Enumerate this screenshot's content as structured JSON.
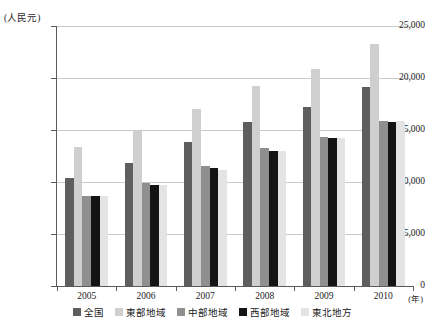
{
  "chart_data": {
    "type": "bar",
    "title": "",
    "xlabel": "(年)",
    "ylabel": "(人民元)",
    "categories": [
      "2005",
      "2006",
      "2007",
      "2008",
      "2009",
      "2010"
    ],
    "ylim": [
      0,
      25000
    ],
    "yticks": [
      "0",
      "5,000",
      "10,000",
      "15,000",
      "20,000",
      "25,000"
    ],
    "ytick_values": [
      0,
      5000,
      10000,
      15000,
      20000,
      25000
    ],
    "grid": true,
    "legend_position": "bottom",
    "series": [
      {
        "name": "全国",
        "color": "#5e5e5e",
        "values": [
          10400,
          11800,
          13800,
          15800,
          17200,
          19100
        ]
      },
      {
        "name": "東部地域",
        "color": "#cfcfcf",
        "values": [
          13400,
          15000,
          17000,
          19200,
          20900,
          23300
        ]
      },
      {
        "name": "中部地域",
        "color": "#8f8f8f",
        "values": [
          8700,
          9900,
          11500,
          13300,
          14300,
          15900
        ]
      },
      {
        "name": "西部地域",
        "color": "#141414",
        "values": [
          8700,
          9700,
          11300,
          13000,
          14200,
          15800
        ]
      },
      {
        "name": "東北地方",
        "color": "#e4e4e4",
        "values": [
          8700,
          9700,
          11200,
          13000,
          14200,
          15900
        ]
      }
    ]
  }
}
